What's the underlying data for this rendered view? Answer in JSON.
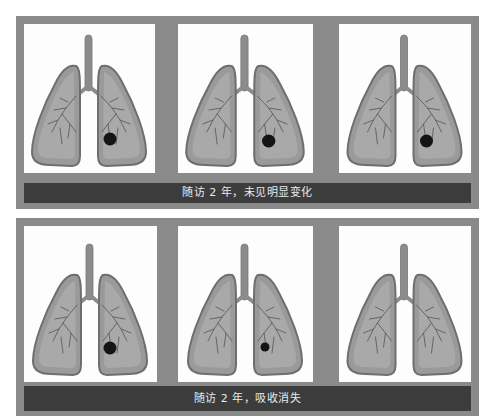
{
  "figure": {
    "colors": {
      "frame": "#8a8a8a",
      "caption_bar": "#3c3c3c",
      "caption_text": "#eaeaea",
      "panel_bg": "#fdfdfd",
      "lung_fill": "#9a9a9a",
      "lung_inner": "#a9a9a9",
      "lung_outline": "#6e6e6e",
      "trachea": "#8c8c8c",
      "bronchi": "#5e5e5e",
      "nodule": "#151515"
    },
    "rows": [
      {
        "caption": "随访 2 年，未见明显变化",
        "panels": [
          {
            "label": "lung-with-nodule",
            "nodule": true,
            "nodule_size": "medium"
          },
          {
            "label": "lung-with-nodule",
            "nodule": true,
            "nodule_size": "medium"
          },
          {
            "label": "lung-with-nodule",
            "nodule": true,
            "nodule_size": "medium"
          }
        ]
      },
      {
        "caption": "随访 2 年，吸收消失",
        "panels": [
          {
            "label": "lung-with-nodule",
            "nodule": true,
            "nodule_size": "medium"
          },
          {
            "label": "lung-with-smaller-nodule",
            "nodule": true,
            "nodule_size": "small"
          },
          {
            "label": "lung-clear",
            "nodule": false,
            "nodule_size": "none"
          }
        ]
      }
    ]
  }
}
